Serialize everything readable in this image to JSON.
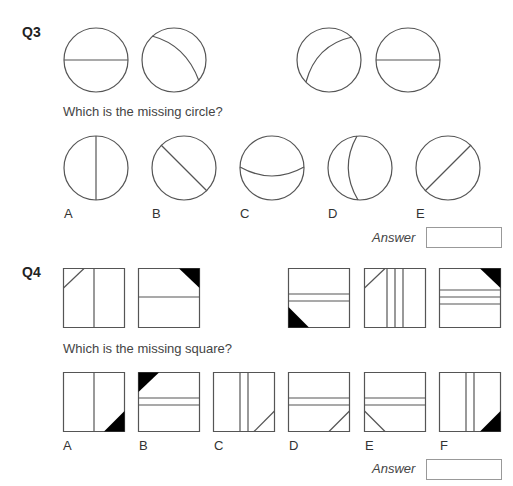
{
  "questions": [
    {
      "id": "Q3",
      "label": "Q3",
      "prompt": "Which is the missing circle?",
      "sequence": [
        {
          "figure": "circle",
          "line": "horizontal-diameter"
        },
        {
          "figure": "circle",
          "line": "arc-top-left-to-bottom-right"
        },
        {
          "figure": "missing"
        },
        {
          "figure": "circle",
          "line": "arc-bottom-left-to-top-right"
        },
        {
          "figure": "circle",
          "line": "horizontal-diameter"
        }
      ],
      "options": [
        {
          "label": "A",
          "line": "vertical-diameter"
        },
        {
          "label": "B",
          "line": "diagonal-top-left-to-bottom-right"
        },
        {
          "label": "C",
          "line": "arc-curved-down-horizontal"
        },
        {
          "label": "D",
          "line": "arc-curved-left-vertical"
        },
        {
          "label": "E",
          "line": "diagonal-bottom-left-to-top-right"
        }
      ],
      "answer_label": "Answer",
      "answer_value": ""
    },
    {
      "id": "Q4",
      "label": "Q4",
      "prompt": "Which is the missing square?",
      "sequence": [
        {
          "figure": "square",
          "desc": "vertical line, top-left corner line"
        },
        {
          "figure": "square",
          "desc": "horizontal line, top-right black triangle"
        },
        {
          "figure": "missing"
        },
        {
          "figure": "square",
          "desc": "two horizontal lines, bottom-left black triangle"
        },
        {
          "figure": "square",
          "desc": "three vertical lines, top-left corner line"
        },
        {
          "figure": "square",
          "desc": "three horizontal lines, top-right black triangle"
        }
      ],
      "options": [
        {
          "label": "A"
        },
        {
          "label": "B"
        },
        {
          "label": "C"
        },
        {
          "label": "D"
        },
        {
          "label": "E"
        },
        {
          "label": "F"
        }
      ],
      "answer_label": "Answer",
      "answer_value": ""
    }
  ],
  "colors": {
    "stroke": "#555555",
    "fill_black": "#000000",
    "answer_border": "#999999"
  }
}
